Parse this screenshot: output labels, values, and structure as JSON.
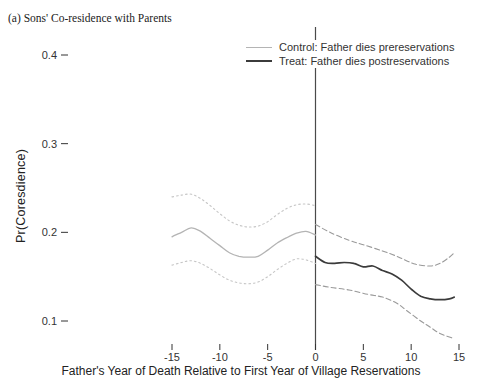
{
  "figure": {
    "title": "(a) Sons' Co-residence with Parents"
  },
  "colors": {
    "background": "#ffffff",
    "text": "#222222",
    "tick": "#333333",
    "reference_line": "#4a4a4a",
    "control_line": "#b4b4b4",
    "control_band": "#c6c6c6",
    "treat_line": "#3b3b3b",
    "treat_band": "#9a9a9a"
  },
  "chart_data": {
    "type": "line",
    "title": "(a) Sons' Co-residence with Parents",
    "xlabel": "Father's Year of Death Relative to First Year of Village Reservations",
    "ylabel": "Pr(Coresdience)",
    "xlim": [
      -17.2,
      16.8
    ],
    "ylim": [
      0.06,
      0.43
    ],
    "x_ticks": [
      -15,
      -10,
      -5,
      0,
      5,
      10,
      15
    ],
    "y_ticks": [
      0.1,
      0.2,
      0.3,
      0.4
    ],
    "grid": false,
    "legend_position": "top-right",
    "reference_line_x": 0,
    "legend": [
      {
        "label": "Control: Father dies prereservations",
        "color": "#b4b4b4",
        "width": 1
      },
      {
        "label": "Treat: Father dies postreservations",
        "color": "#3b3b3b",
        "width": 2
      }
    ],
    "series": [
      {
        "name": "control",
        "style": "solid",
        "color": "#b4b4b4",
        "width": 1.3,
        "x": [
          -15,
          -14,
          -13,
          -12,
          -11,
          -10,
          -9,
          -8,
          -7,
          -6,
          -5,
          -4,
          -3,
          -2,
          -1,
          0
        ],
        "y": [
          0.195,
          0.2,
          0.205,
          0.201,
          0.193,
          0.185,
          0.177,
          0.173,
          0.172,
          0.173,
          0.18,
          0.188,
          0.194,
          0.199,
          0.201,
          0.197
        ]
      },
      {
        "name": "control-upper-ci",
        "style": "dotted",
        "color": "#c6c6c6",
        "width": 1.1,
        "x": [
          -15,
          -14,
          -13,
          -12,
          -11,
          -10,
          -9,
          -8,
          -7,
          -6,
          -5,
          -4,
          -3,
          -2,
          -1,
          0
        ],
        "y": [
          0.24,
          0.242,
          0.243,
          0.238,
          0.23,
          0.221,
          0.213,
          0.208,
          0.206,
          0.207,
          0.212,
          0.22,
          0.227,
          0.231,
          0.232,
          0.23
        ]
      },
      {
        "name": "control-lower-ci",
        "style": "dotted",
        "color": "#c6c6c6",
        "width": 1.1,
        "x": [
          -15,
          -14,
          -13,
          -12,
          -11,
          -10,
          -9,
          -8,
          -7,
          -6,
          -5,
          -4,
          -3,
          -2,
          -1,
          0
        ],
        "y": [
          0.163,
          0.166,
          0.168,
          0.165,
          0.159,
          0.152,
          0.146,
          0.143,
          0.142,
          0.144,
          0.15,
          0.158,
          0.165,
          0.17,
          0.169,
          0.165
        ]
      },
      {
        "name": "treat",
        "style": "solid",
        "color": "#3b3b3b",
        "width": 1.7,
        "x": [
          0,
          1,
          2,
          3,
          4,
          5,
          6,
          7,
          8,
          9,
          10,
          11,
          12,
          13,
          14,
          14.5
        ],
        "y": [
          0.173,
          0.166,
          0.165,
          0.166,
          0.165,
          0.161,
          0.162,
          0.157,
          0.153,
          0.146,
          0.136,
          0.128,
          0.125,
          0.124,
          0.125,
          0.127
        ]
      },
      {
        "name": "treat-upper-ci",
        "style": "dashed",
        "color": "#9a9a9a",
        "width": 1.1,
        "x": [
          0,
          1.5,
          3.5,
          5,
          7,
          8.5,
          9.5,
          10.5,
          12,
          13,
          14,
          14.5
        ],
        "y": [
          0.209,
          0.2,
          0.191,
          0.186,
          0.179,
          0.173,
          0.168,
          0.164,
          0.162,
          0.165,
          0.172,
          0.177
        ]
      },
      {
        "name": "treat-lower-ci",
        "style": "dashed",
        "color": "#9a9a9a",
        "width": 1.1,
        "x": [
          0,
          1.5,
          3.5,
          5.5,
          7,
          8.5,
          9.5,
          11,
          12,
          13,
          14.5
        ],
        "y": [
          0.141,
          0.138,
          0.135,
          0.13,
          0.127,
          0.12,
          0.112,
          0.1,
          0.093,
          0.086,
          0.08
        ]
      }
    ]
  }
}
